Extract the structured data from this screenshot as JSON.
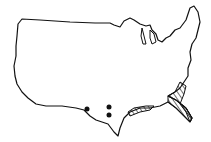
{
  "map": {
    "subject": "contiguous-united-states-outline",
    "stroke_color": "#111111",
    "fill_color": "#ffffff",
    "hatch_color": "#111111",
    "hatched_regions": [
      {
        "name": "florida-peninsula-and-georgia-coast"
      },
      {
        "name": "gulf-coast-louisiana-mississippi-alabama"
      }
    ],
    "points": [
      {
        "name": "texas-point-1",
        "x": 87,
        "y": 109
      },
      {
        "name": "texas-point-2",
        "x": 109,
        "y": 107
      },
      {
        "name": "texas-point-3",
        "x": 109,
        "y": 115
      }
    ]
  }
}
